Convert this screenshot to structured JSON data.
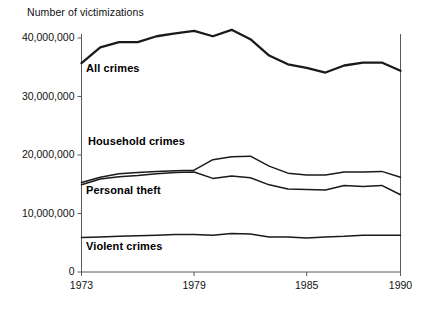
{
  "chart_data": {
    "type": "line",
    "title": "Number of victimizations",
    "xlabel": "",
    "ylabel": "",
    "x": [
      1973,
      1974,
      1975,
      1976,
      1977,
      1978,
      1979,
      1980,
      1981,
      1982,
      1983,
      1984,
      1985,
      1986,
      1987,
      1988,
      1989,
      1990
    ],
    "xlim": [
      1973,
      1990
    ],
    "ylim": [
      0,
      42000000
    ],
    "yticks": [
      0,
      10000000,
      20000000,
      30000000,
      40000000
    ],
    "ytick_labels": [
      "0",
      "10,000,000",
      "20,000,000",
      "30,000,000",
      "40,000,000"
    ],
    "xticks": [
      1973,
      1979,
      1985,
      1990
    ],
    "xtick_labels": [
      "1973",
      "1979",
      "1985",
      "1990"
    ],
    "grid": false,
    "legend": "inline-labels",
    "line_color": "#1a1a1a",
    "series": [
      {
        "name": "All crimes",
        "label_position": {
          "x": 86,
          "y": 62
        },
        "values": [
          35700000,
          38400000,
          39300000,
          39300000,
          40300000,
          40800000,
          41200000,
          40300000,
          41400000,
          39800000,
          37000000,
          35500000,
          34900000,
          34100000,
          35300000,
          35800000,
          35800000,
          34400000
        ]
      },
      {
        "name": "Household crimes",
        "label_position": {
          "x": 88,
          "y": 135
        },
        "values": [
          15300000,
          16200000,
          16800000,
          17000000,
          17200000,
          17300000,
          17400000,
          19200000,
          19700000,
          19800000,
          18100000,
          16900000,
          16600000,
          16600000,
          17100000,
          17100000,
          17200000,
          16200000
        ]
      },
      {
        "name": "Personal theft",
        "label_position": {
          "x": 86,
          "y": 184
        },
        "values": [
          14900000,
          15900000,
          16300000,
          16500000,
          16800000,
          17000000,
          17100000,
          16000000,
          16400000,
          16100000,
          14900000,
          14200000,
          14100000,
          14000000,
          14800000,
          14600000,
          14800000,
          13200000
        ]
      },
      {
        "name": "Violent crimes",
        "label_position": {
          "x": 86,
          "y": 240
        },
        "values": [
          5900000,
          6000000,
          6100000,
          6200000,
          6300000,
          6400000,
          6400000,
          6300000,
          6600000,
          6500000,
          6000000,
          6000000,
          5800000,
          6000000,
          6100000,
          6300000,
          6300000,
          6300000
        ]
      }
    ]
  },
  "axes": {
    "y_axis_name": "y-axis",
    "x_axis_name": "x-axis"
  }
}
